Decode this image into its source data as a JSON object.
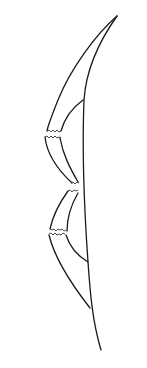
{
  "figure": {
    "stroke_color": "#1a1a1a",
    "background_color": "#ffffff"
  }
}
